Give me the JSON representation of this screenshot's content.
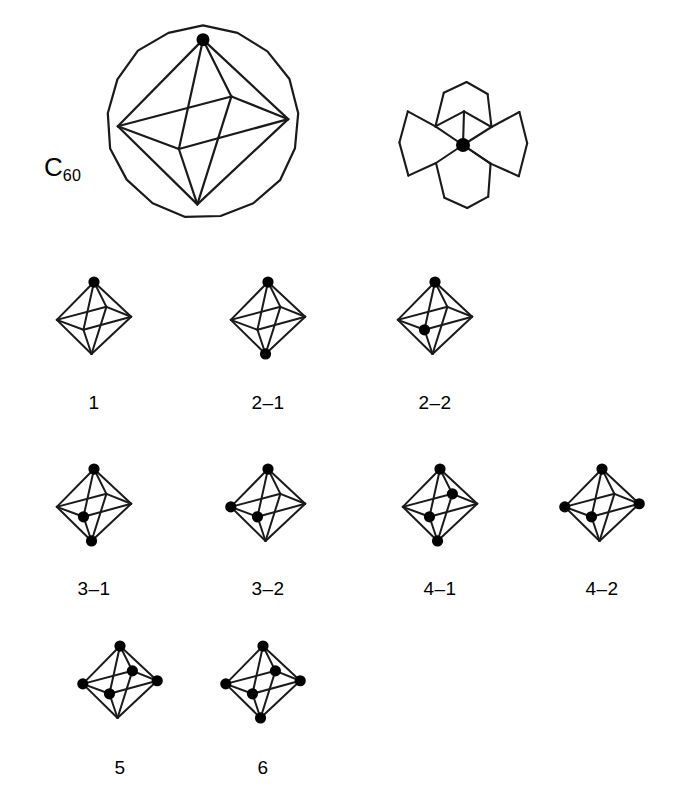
{
  "figure": {
    "background_color": "#ffffff",
    "ink_color": "#1a1a1a",
    "vertex_dot_color": "#000000"
  },
  "header": {
    "c60_label_text": "C",
    "c60_label_subscript": "60",
    "c60_label_full": "C60",
    "sphere_caption": "",
    "fragment_caption": ""
  },
  "octahedron_geometry": {
    "description": "Octahedron drawn in perspective with six vertices",
    "vertices": [
      {
        "key": "top",
        "x": 0,
        "y": -58
      },
      {
        "key": "bottom",
        "x": -4,
        "y": 58
      },
      {
        "key": "left",
        "x": -60,
        "y": 3
      },
      {
        "key": "right",
        "x": 60,
        "y": -2
      },
      {
        "key": "front",
        "x": -17,
        "y": 19
      },
      {
        "key": "back",
        "x": 20,
        "y": -18
      }
    ],
    "edges": [
      [
        "top",
        "left"
      ],
      [
        "top",
        "right"
      ],
      [
        "top",
        "front"
      ],
      [
        "top",
        "back"
      ],
      [
        "bottom",
        "left"
      ],
      [
        "bottom",
        "right"
      ],
      [
        "bottom",
        "front"
      ],
      [
        "bottom",
        "back"
      ],
      [
        "left",
        "front"
      ],
      [
        "front",
        "right"
      ],
      [
        "right",
        "back"
      ],
      [
        "back",
        "left"
      ]
    ]
  },
  "sphere": {
    "label": "C60 sphere outline",
    "center_x": 203,
    "center_y": 122,
    "radius": 96,
    "sides": 17,
    "octahedron_scale": 1.42
  },
  "fragment": {
    "label": "corannulene-type fragment",
    "center_x": 465,
    "center_y": 125,
    "ring_count": 4,
    "ring_types": [
      "pentagon",
      "hexagon",
      "hexagon",
      "pentagon"
    ],
    "marked_atom": "central junction atom"
  },
  "isomers": [
    {
      "id": "1",
      "label": "1",
      "center_x": 94,
      "center_y": 318,
      "label_x": 94,
      "label_y": 392,
      "marked_vertices": [
        "top"
      ],
      "substituent_count": 1
    },
    {
      "id": "2-1",
      "label": "2–1",
      "center_x": 268,
      "center_y": 318,
      "label_x": 268,
      "label_y": 392,
      "marked_vertices": [
        "top",
        "bottom"
      ],
      "substituent_count": 2
    },
    {
      "id": "2-2",
      "label": "2–2",
      "center_x": 435,
      "center_y": 318,
      "label_x": 435,
      "label_y": 392,
      "marked_vertices": [
        "top",
        "front"
      ],
      "substituent_count": 2
    },
    {
      "id": "3-1",
      "label": "3–1",
      "center_x": 94,
      "center_y": 505,
      "label_x": 94,
      "label_y": 578,
      "marked_vertices": [
        "top",
        "front",
        "bottom"
      ],
      "substituent_count": 3
    },
    {
      "id": "3-2",
      "label": "3–2",
      "center_x": 268,
      "center_y": 505,
      "label_x": 268,
      "label_y": 578,
      "marked_vertices": [
        "top",
        "left",
        "front"
      ],
      "substituent_count": 3
    },
    {
      "id": "4-1",
      "label": "4–1",
      "center_x": 440,
      "center_y": 505,
      "label_x": 440,
      "label_y": 578,
      "marked_vertices": [
        "top",
        "back",
        "front",
        "bottom"
      ],
      "substituent_count": 4
    },
    {
      "id": "4-2",
      "label": "4–2",
      "center_x": 602,
      "center_y": 505,
      "label_x": 602,
      "label_y": 578,
      "marked_vertices": [
        "top",
        "left",
        "front",
        "right"
      ],
      "substituent_count": 4
    },
    {
      "id": "5",
      "label": "5",
      "center_x": 120,
      "center_y": 682,
      "label_x": 120,
      "label_y": 757,
      "marked_vertices": [
        "top",
        "left",
        "front",
        "right",
        "back"
      ],
      "substituent_count": 5
    },
    {
      "id": "6",
      "label": "6",
      "center_x": 263,
      "center_y": 682,
      "label_x": 263,
      "label_y": 757,
      "marked_vertices": [
        "top",
        "left",
        "front",
        "right",
        "back",
        "bottom"
      ],
      "substituent_count": 6
    }
  ]
}
